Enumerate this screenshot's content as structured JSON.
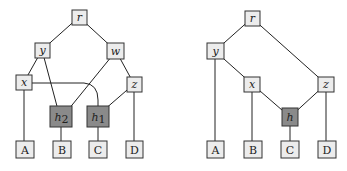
{
  "left_graph": {
    "nodes": {
      "r": {
        "label": "r",
        "sub": ""
      },
      "y": {
        "label": "y",
        "sub": ""
      },
      "w": {
        "label": "w",
        "sub": ""
      },
      "x": {
        "label": "x",
        "sub": ""
      },
      "z": {
        "label": "z",
        "sub": ""
      },
      "h2": {
        "label": "h",
        "sub": "2"
      },
      "h1": {
        "label": "h",
        "sub": "1"
      },
      "A": {
        "label": "A"
      },
      "B": {
        "label": "B"
      },
      "C": {
        "label": "C"
      },
      "D": {
        "label": "D"
      }
    },
    "edges": [
      [
        "r",
        "y"
      ],
      [
        "r",
        "w"
      ],
      [
        "y",
        "x"
      ],
      [
        "y",
        "h2"
      ],
      [
        "w",
        "h2"
      ],
      [
        "w",
        "z"
      ],
      [
        "x",
        "A"
      ],
      [
        "x",
        "h1"
      ],
      [
        "z",
        "h1"
      ],
      [
        "z",
        "D"
      ],
      [
        "h2",
        "B"
      ],
      [
        "h1",
        "C"
      ]
    ]
  },
  "right_graph": {
    "nodes": {
      "r": {
        "label": "r"
      },
      "y": {
        "label": "y"
      },
      "x": {
        "label": "x"
      },
      "z": {
        "label": "z"
      },
      "h": {
        "label": "h"
      },
      "A": {
        "label": "A"
      },
      "B": {
        "label": "B"
      },
      "C": {
        "label": "C"
      },
      "D": {
        "label": "D"
      }
    },
    "edges": [
      [
        "r",
        "y"
      ],
      [
        "r",
        "z"
      ],
      [
        "y",
        "A"
      ],
      [
        "y",
        "x"
      ],
      [
        "x",
        "B"
      ],
      [
        "x",
        "h"
      ],
      [
        "z",
        "h"
      ],
      [
        "z",
        "D"
      ],
      [
        "h",
        "C"
      ]
    ]
  },
  "colors": {
    "light_node": "#ececec",
    "dark_node": "#8a8a8a",
    "edge": "#222222"
  }
}
